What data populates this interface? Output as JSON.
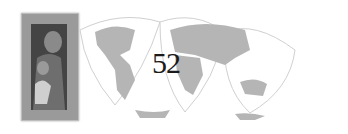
{
  "page": {
    "number": "52"
  },
  "graphics": {
    "framed_icon": "framed-religious-icon-image",
    "map": "interrupted-world-map-projection"
  },
  "colors": {
    "land": "#b5b5b5",
    "ocean": "#ffffff",
    "outline": "#d0d0d0",
    "frame": "#9a9a9a",
    "text": "#1a1a1a"
  }
}
